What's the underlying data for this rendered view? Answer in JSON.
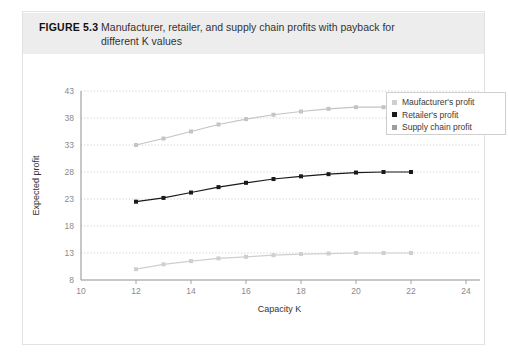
{
  "figure": {
    "number": "FIGURE 5.3",
    "caption_line1": "Manufacturer, retailer, and supply chain profits with payback for",
    "caption_line2": "different K values"
  },
  "legend": {
    "position": "top-right",
    "items": [
      {
        "label": "Maufacturer's profit",
        "color": "#cfcfcf"
      },
      {
        "label": "Retailer's profit",
        "color": "#1a1a1a"
      },
      {
        "label": "Supply chain profit",
        "color": "#9e9e9e"
      }
    ]
  },
  "chart_data": {
    "type": "line",
    "title": "Manufacturer, retailer, and supply chain profits with payback for different K values",
    "xlabel": "Capacity K",
    "ylabel": "Expected profit",
    "xlim": [
      10,
      24
    ],
    "ylim": [
      8,
      43
    ],
    "xticks": [
      10,
      12,
      14,
      16,
      18,
      20,
      22,
      24
    ],
    "yticks": [
      8,
      13,
      18,
      23,
      28,
      33,
      38,
      43
    ],
    "grid": "horizontal-dotted",
    "x": [
      12,
      13,
      14,
      15,
      16,
      17,
      18,
      19,
      20,
      21,
      22
    ],
    "series": [
      {
        "name": "Maufacturer's profit",
        "color": "#cfcfcf",
        "marker": "square",
        "values": [
          10.0,
          10.9,
          11.5,
          12.0,
          12.3,
          12.6,
          12.8,
          12.9,
          13.0,
          13.0,
          13.0
        ]
      },
      {
        "name": "Retailer's profit",
        "color": "#1a1a1a",
        "marker": "square",
        "values": [
          22.5,
          23.2,
          24.2,
          25.2,
          26.0,
          26.7,
          27.2,
          27.6,
          27.9,
          28.0,
          28.0
        ]
      },
      {
        "name": "Supply chain profit",
        "color": "#c4c4c4",
        "marker": "square",
        "values": [
          33.0,
          34.2,
          35.5,
          36.8,
          37.8,
          38.6,
          39.2,
          39.7,
          40.0,
          40.0,
          40.0
        ]
      }
    ]
  }
}
